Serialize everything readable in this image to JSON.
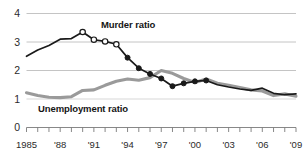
{
  "chart_data": {
    "type": "line",
    "title": "",
    "subtitle": "",
    "xlabel": "",
    "ylabel": "",
    "xlim": [
      1985,
      2009
    ],
    "ylim": [
      0,
      4
    ],
    "grid": true,
    "gridlines_y": [
      1,
      2,
      3,
      4
    ],
    "legend_position": "inline-annotation",
    "y_ticks": [
      "0",
      "1",
      "2",
      "3",
      "4"
    ],
    "y_tick_values": [
      0,
      1,
      2,
      3,
      4
    ],
    "x_ticks": [
      "1985",
      "'88",
      "'91",
      "'94",
      "'97",
      "'00",
      "'03",
      "'06",
      "'09"
    ],
    "x_tick_values": [
      1985,
      1988,
      1991,
      1994,
      1997,
      2000,
      2003,
      2006,
      2009
    ],
    "x_minor_tick_interval": 1,
    "x": [
      1985,
      1986,
      1987,
      1988,
      1989,
      1990,
      1991,
      1992,
      1993,
      1994,
      1995,
      1996,
      1997,
      1998,
      1999,
      2000,
      2001,
      2002,
      2003,
      2004,
      2005,
      2006,
      2007,
      2008,
      2009
    ],
    "series": [
      {
        "name": "Murder ratio",
        "color": "#1a1a1a",
        "marker": "mixed-open-circle-then-filled",
        "values": [
          2.5,
          2.72,
          2.88,
          3.1,
          3.12,
          3.35,
          3.08,
          3.02,
          2.92,
          2.45,
          2.08,
          1.88,
          1.72,
          1.45,
          1.55,
          1.62,
          1.65,
          1.5,
          1.42,
          1.35,
          1.3,
          1.38,
          1.2,
          1.15,
          1.18
        ]
      },
      {
        "name": "Unemployment ratio",
        "color": "#9a9a9a",
        "marker": "none",
        "values": [
          1.22,
          1.12,
          1.06,
          1.05,
          1.08,
          1.3,
          1.32,
          1.48,
          1.62,
          1.7,
          1.66,
          1.75,
          2.0,
          1.9,
          1.72,
          1.58,
          1.7,
          1.55,
          1.48,
          1.4,
          1.32,
          1.28,
          1.12,
          1.18,
          1.1
        ]
      }
    ],
    "annotations": [
      {
        "text": "Murder ratio",
        "series": "Murder ratio",
        "x": 1993.3,
        "y": 3.48
      },
      {
        "text": "Unemployment ratio",
        "series": "Unemployment ratio",
        "x": 1987.2,
        "y": 0.72
      }
    ]
  },
  "colors": {
    "murder_line": "#1a1a1a",
    "unemployment_line": "#9a9a9a",
    "gridline": "#b5b5b5",
    "axis": "#7a7a7a",
    "text": "#2b2b2b"
  }
}
